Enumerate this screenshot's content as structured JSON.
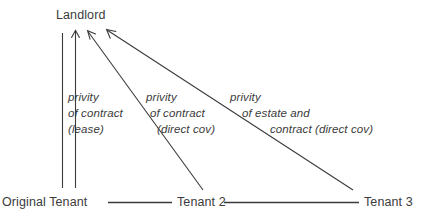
{
  "diagram": {
    "type": "relationship-diagram",
    "background_color": "#ffffff",
    "stroke_color": "#3b3b3b",
    "text_color": "#3b3b3b",
    "nodes": [
      {
        "id": "landlord",
        "label": "Landlord"
      },
      {
        "id": "original_tenant",
        "label": "Original Tenant"
      },
      {
        "id": "tenant_2",
        "label": "Tenant 2"
      },
      {
        "id": "tenant_3",
        "label": "Tenant 3"
      }
    ],
    "edge_labels": [
      {
        "id": "label_1",
        "from": "original_tenant",
        "to": "landlord",
        "line_1": "privity",
        "line_2": "of contract",
        "line_3": "(lease)"
      },
      {
        "id": "label_2",
        "from": "tenant_2",
        "to": "landlord",
        "line_1": "privity",
        "line_2": "of contract",
        "line_3": "(direct cov)"
      },
      {
        "id": "label_3",
        "from": "tenant_3",
        "to": "landlord",
        "line_1": "privity",
        "line_2": "of estate and",
        "line_3": "contract (direct cov)"
      }
    ]
  }
}
